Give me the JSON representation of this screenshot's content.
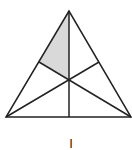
{
  "figure": {
    "label": "I",
    "vertices": {
      "apex": [
        69,
        11
      ],
      "bottom_left": [
        6,
        117
      ],
      "bottom_right": [
        131,
        117
      ]
    },
    "centroid": [
      69,
      79
    ],
    "midpoints": {
      "left_side": [
        39,
        62
      ],
      "right_side": [
        99,
        62
      ],
      "base": [
        69,
        117
      ]
    },
    "shaded_region": [
      "apex",
      "left_side_midpoint",
      "centroid"
    ],
    "colors": {
      "stroke": "#222222",
      "shade": "#d9d9d9",
      "background": "#ffffff"
    }
  }
}
